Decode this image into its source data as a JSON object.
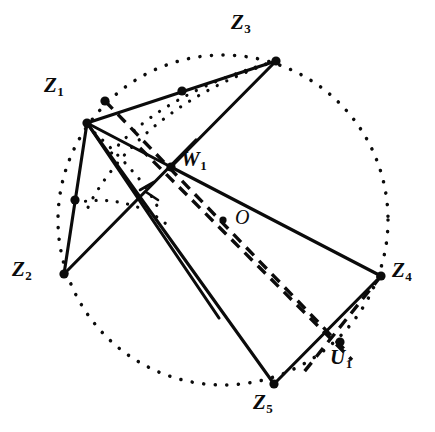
{
  "figure": {
    "canvas": {
      "width": 435,
      "height": 432
    },
    "background_color": "#ffffff",
    "ink_color": "#0b0b0b"
  },
  "circle": {
    "name": "circumscribed-circle",
    "style": "dotted",
    "center": {
      "x": 223,
      "y": 220
    },
    "radius": 165
  },
  "points": [
    {
      "id": "Z1",
      "label": "Z",
      "subscript": "1",
      "x": 87,
      "y": 123,
      "label_x": 44,
      "label_y": 75,
      "on_circle": true,
      "marker": "dot"
    },
    {
      "id": "Z2",
      "label": "Z",
      "subscript": "2",
      "x": 64,
      "y": 274,
      "label_x": 12,
      "label_y": 259,
      "on_circle": true,
      "marker": "dot"
    },
    {
      "id": "Z3",
      "label": "Z",
      "subscript": "3",
      "x": 276,
      "y": 61,
      "label_x": 231,
      "label_y": 12,
      "on_circle": true,
      "marker": "dot"
    },
    {
      "id": "Z4",
      "label": "Z",
      "subscript": "4",
      "x": 381,
      "y": 276,
      "label_x": 392,
      "label_y": 260,
      "on_circle": true,
      "marker": "dot"
    },
    {
      "id": "Z5",
      "label": "Z",
      "subscript": "5",
      "x": 274,
      "y": 384,
      "label_x": 253,
      "label_y": 392,
      "on_circle": true,
      "marker": "dot"
    },
    {
      "id": "W1",
      "label": "W",
      "subscript": "1",
      "x": 171,
      "y": 167,
      "label_x": 181,
      "label_y": 149,
      "on_circle": false,
      "marker": "dot"
    },
    {
      "id": "O",
      "label": "O",
      "subscript": "",
      "x": 223,
      "y": 220,
      "label_x": 235,
      "label_y": 207,
      "on_circle": false,
      "marker": "dot"
    },
    {
      "id": "U1",
      "label": "U",
      "subscript": "1",
      "x": 340,
      "y": 342,
      "label_x": 330,
      "label_y": 347,
      "on_circle": false,
      "marker": "dot"
    }
  ],
  "unlabeled_dots": [
    {
      "name": "dot-near-z1",
      "x": 105,
      "y": 101
    },
    {
      "name": "dot-on-z1-z3",
      "x": 182,
      "y": 91
    },
    {
      "name": "dot-on-z1-z2",
      "x": 75,
      "y": 200
    }
  ],
  "solid_segments": [
    {
      "name": "seg-z1-z3",
      "x1": 87,
      "y1": 123,
      "x2": 276,
      "y2": 61
    },
    {
      "name": "seg-z1-z2",
      "x1": 87,
      "y1": 123,
      "x2": 64,
      "y2": 274
    },
    {
      "name": "seg-z1-w1",
      "x1": 87,
      "y1": 123,
      "x2": 171,
      "y2": 167
    },
    {
      "name": "seg-z1-z5",
      "x1": 87,
      "y1": 123,
      "x2": 274,
      "y2": 384
    },
    {
      "name": "seg-z1-u1b",
      "x1": 87,
      "y1": 123,
      "x2": 219,
      "y2": 318
    },
    {
      "name": "seg-z3-w1",
      "x1": 276,
      "y1": 61,
      "x2": 171,
      "y2": 167
    },
    {
      "name": "seg-w1-z4",
      "x1": 171,
      "y1": 167,
      "x2": 381,
      "y2": 276
    },
    {
      "name": "seg-z2-w1x",
      "x1": 64,
      "y1": 274,
      "x2": 196,
      "y2": 140
    },
    {
      "name": "seg-z4-z5",
      "x1": 381,
      "y1": 276,
      "x2": 274,
      "y2": 384
    }
  ],
  "dashed_segments": [
    {
      "name": "dash-nearz1-u1",
      "x1": 105,
      "y1": 101,
      "x2": 347,
      "y2": 352
    },
    {
      "name": "dash-w1-u1",
      "x1": 140,
      "y1": 148,
      "x2": 352,
      "y2": 360
    },
    {
      "name": "dash-z4-u1",
      "x1": 381,
      "y1": 276,
      "x2": 300,
      "y2": 377
    }
  ],
  "dotted_arcs": [
    {
      "name": "arc-z3-to-z1-inner",
      "d": "M 276 61 Q 200 82 150 118 Q 120 140 108 158"
    },
    {
      "name": "arc-z3-to-z2-outer",
      "d": "M 276 61 Q 176 95 120 160 Q 95 190 86 212"
    },
    {
      "name": "arc-z1-to-w1-lower",
      "d": "M 87 126 Q 115 150 140 180 Q 155 200 160 212"
    },
    {
      "name": "arc-z2-side-small",
      "d": "M 75 203 Q 108 196 140 208 Q 158 216 166 224"
    }
  ],
  "tick_marks": [
    {
      "name": "tick-on-z2-w1",
      "x1": 140,
      "y1": 190,
      "x2": 154,
      "y2": 182
    },
    {
      "name": "tick-on-z1-z5",
      "x1": 146,
      "y1": 192,
      "x2": 158,
      "y2": 200
    }
  ],
  "legend": {
    "solid_meaning": "chords and sides",
    "dashed_meaning": "construction lines to U1",
    "dotted_meaning": "circumscribed circle and auxiliary arcs"
  }
}
